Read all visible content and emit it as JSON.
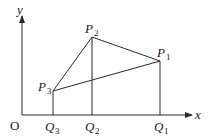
{
  "diagram": {
    "axes": {
      "x_label": "x",
      "y_label": "y",
      "origin_label": "O"
    },
    "points": [
      {
        "id": "P1",
        "letter": "P",
        "sub": "1"
      },
      {
        "id": "P2",
        "letter": "P",
        "sub": "2"
      },
      {
        "id": "P3",
        "letter": "P",
        "sub": "3"
      },
      {
        "id": "Q1",
        "letter": "Q",
        "sub": "1"
      },
      {
        "id": "Q2",
        "letter": "Q",
        "sub": "2"
      },
      {
        "id": "Q3",
        "letter": "Q",
        "sub": "3"
      }
    ],
    "segments": [
      [
        "P3",
        "P2"
      ],
      [
        "P2",
        "P1"
      ],
      [
        "P1",
        "P3"
      ],
      [
        "P3",
        "Q3"
      ],
      [
        "P2",
        "Q2"
      ],
      [
        "P1",
        "Q1"
      ]
    ],
    "colors": {
      "ink": "#2a2a2a",
      "background": "#ffffff"
    }
  }
}
